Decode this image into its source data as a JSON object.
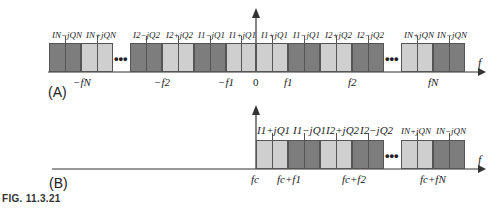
{
  "figure_caption": "FIG. 11.3.21",
  "panel_a": {
    "label": "(A)",
    "axis_label": "f",
    "blocks": [
      {
        "x": 49,
        "w": 32,
        "shade": "dark"
      },
      {
        "x": 81,
        "w": 32,
        "shade": "light"
      },
      {
        "x": 130,
        "w": 32,
        "shade": "dark"
      },
      {
        "x": 162,
        "w": 32,
        "shade": "light"
      },
      {
        "x": 194,
        "w": 32,
        "shade": "dark"
      },
      {
        "x": 226,
        "w": 30,
        "shade": "light"
      },
      {
        "x": 256,
        "w": 32,
        "shade": "light"
      },
      {
        "x": 288,
        "w": 32,
        "shade": "dark"
      },
      {
        "x": 320,
        "w": 32,
        "shade": "light"
      },
      {
        "x": 352,
        "w": 32,
        "shade": "dark"
      },
      {
        "x": 401,
        "w": 32,
        "shade": "light"
      },
      {
        "x": 433,
        "w": 32,
        "shade": "dark"
      }
    ],
    "block_labels": [
      "IN−jQN",
      "IN+jQN",
      "I2−jQ2",
      "I2+jQ2",
      "I1−jQ1",
      "I1+jQ1",
      "I1+jQ1",
      "I1−jQ1",
      "I2+jQ2",
      "I2−jQ2",
      "IN+jQN",
      "IN−jQN"
    ],
    "ellipses": [
      "•••",
      "•••"
    ],
    "tick_labels": [
      "−fN",
      "−f2",
      "−f1",
      "0",
      "f1",
      "f2",
      "fN"
    ]
  },
  "panel_b": {
    "label": "(B)",
    "axis_label": "f",
    "blocks": [
      {
        "x": 256,
        "w": 32,
        "shade": "light"
      },
      {
        "x": 288,
        "w": 32,
        "shade": "dark"
      },
      {
        "x": 320,
        "w": 32,
        "shade": "light"
      },
      {
        "x": 352,
        "w": 32,
        "shade": "dark"
      },
      {
        "x": 401,
        "w": 32,
        "shade": "light"
      },
      {
        "x": 433,
        "w": 32,
        "shade": "dark"
      }
    ],
    "block_labels": [
      "I1+jQ1",
      "I1−jQ1",
      "I2+jQ2",
      "I2−jQ2",
      "IN+jQN",
      "IN−jQN"
    ],
    "ellipses": [
      "•••"
    ],
    "tick_labels": [
      "fc",
      "fc+f1",
      "fc+f2",
      "fc+fN"
    ]
  }
}
